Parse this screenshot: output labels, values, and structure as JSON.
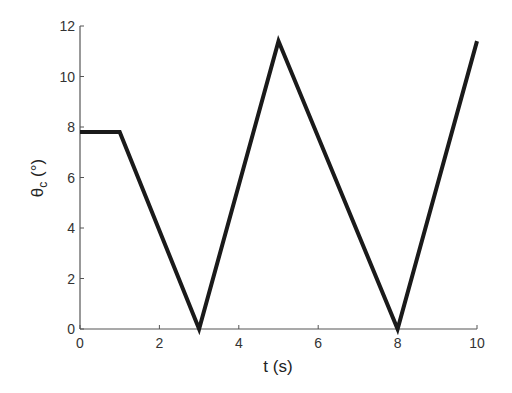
{
  "chart_data": {
    "type": "line",
    "title": "",
    "xlabel": "t (s)",
    "ylabel_main": "θ",
    "ylabel_sub": "c",
    "ylabel_unit": " (°)",
    "xlim": [
      0,
      10
    ],
    "ylim": [
      0,
      12
    ],
    "xticks": [
      0,
      2,
      4,
      6,
      8,
      10
    ],
    "yticks": [
      0,
      2,
      4,
      6,
      8,
      10,
      12
    ],
    "xtick_labels": [
      "0",
      "2",
      "4",
      "6",
      "8",
      "10"
    ],
    "ytick_labels": [
      "0",
      "2",
      "4",
      "6",
      "8",
      "10",
      "12"
    ],
    "grid": false,
    "series": [
      {
        "name": "theta_c",
        "color": "#1a1a1a",
        "x": [
          0,
          1,
          3,
          5,
          8,
          10
        ],
        "y": [
          7.8,
          7.8,
          0,
          11.4,
          0,
          11.4
        ]
      }
    ]
  }
}
